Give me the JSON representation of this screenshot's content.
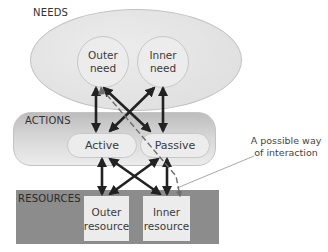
{
  "groups": {
    "needs": {
      "label": "NEEDS",
      "fill": "#e4e4e4"
    },
    "actions": {
      "label": "ACTIONS",
      "fill": "#d0d0d0"
    },
    "resources": {
      "label": "RESOURCES",
      "fill": "#8c8c8c"
    }
  },
  "nodes": {
    "outer_need": {
      "line1": "Outer",
      "line2": "need"
    },
    "inner_need": {
      "line1": "Inner",
      "line2": "need"
    },
    "active": {
      "label": "Active"
    },
    "passive": {
      "label": "Passive"
    },
    "outer_resource": {
      "line1": "Outer",
      "line2": "resource"
    },
    "inner_resource": {
      "line1": "Inner",
      "line2": "resource"
    }
  },
  "edges": [
    {
      "from": "outer_need",
      "to": "active",
      "style": "solid",
      "bidirectional": true
    },
    {
      "from": "outer_need",
      "to": "passive",
      "style": "solid",
      "bidirectional": true
    },
    {
      "from": "inner_need",
      "to": "active",
      "style": "solid",
      "bidirectional": true
    },
    {
      "from": "inner_need",
      "to": "passive",
      "style": "solid",
      "bidirectional": true
    },
    {
      "from": "active",
      "to": "outer_resource",
      "style": "solid",
      "bidirectional": true
    },
    {
      "from": "active",
      "to": "inner_resource",
      "style": "solid",
      "bidirectional": true
    },
    {
      "from": "passive",
      "to": "outer_resource",
      "style": "solid",
      "bidirectional": true
    },
    {
      "from": "passive",
      "to": "inner_resource",
      "style": "solid",
      "bidirectional": true
    },
    {
      "from": "inner_resource",
      "to": "outer_need",
      "style": "dashed",
      "bidirectional": false
    }
  ],
  "annotation": {
    "line1": "A possible way",
    "line2": "of interaction",
    "points_to": "dashed-path"
  },
  "colors": {
    "arrow": "#222222",
    "dashed": "#6e6e6e",
    "leader": "#a8a8a8"
  }
}
